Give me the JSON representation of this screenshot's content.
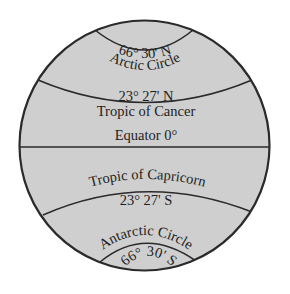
{
  "diagram": {
    "colors": {
      "globe_fill": "#cfcfcf",
      "line": "#2a2a2a",
      "text": "#1e1e1e",
      "background": "#ffffff"
    },
    "lines": [
      {
        "name": "arctic-circle",
        "degree": "66° 30' N",
        "label": "Arctic Circle"
      },
      {
        "name": "tropic-of-cancer",
        "degree": "23° 27' N",
        "label": "Tropic of Cancer"
      },
      {
        "name": "equator",
        "label": "Equator 0°"
      },
      {
        "name": "tropic-of-capricorn",
        "label": "Tropic of Capricorn",
        "degree": "23° 27' S"
      },
      {
        "name": "antarctic-circle",
        "label": "Antarctic Circle",
        "degree": "66° 30' S"
      }
    ]
  }
}
